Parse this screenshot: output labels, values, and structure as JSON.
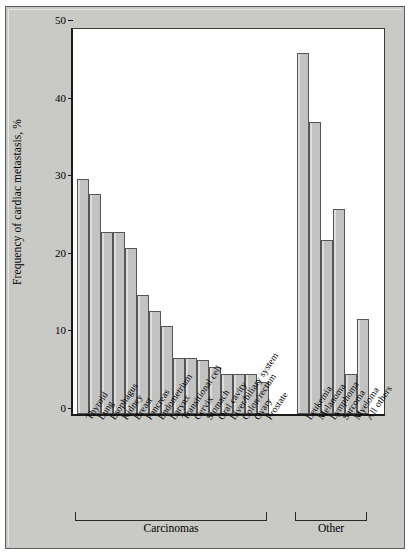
{
  "figure": {
    "background": "#c9c9c6",
    "plot_background": "#ffffff",
    "bar_fill": "#c2c2c0",
    "bar_stroke": "#56565a"
  },
  "chart_data": {
    "type": "bar",
    "title": "",
    "xlabel": "",
    "ylabel": "Frequency of cardiac metastasis, %",
    "ylim": [
      0,
      50
    ],
    "yticks": [
      0,
      10,
      20,
      30,
      40,
      50
    ],
    "ytick_labels": [
      "0",
      "10",
      "20",
      "30",
      "40",
      "50"
    ],
    "grid": false,
    "legend": "none",
    "categories": [
      "Thyroid",
      "Lung",
      "Esophagus",
      "Kidney",
      "Breast",
      "Pancreas",
      "Endometrium",
      "Larynx",
      "Transitional cell",
      "Cervix",
      "Stomach",
      "Oral cavity",
      "Liver/biliary system",
      "Colon/rectum",
      "Ovary",
      "Prostate",
      "Leukemia",
      "Melanoma",
      "Lymphoma",
      "Sarcoma",
      "Myeloma",
      "All others"
    ],
    "values": [
      30.3,
      28.4,
      23.5,
      23.5,
      21.4,
      15.3,
      13.3,
      11.3,
      7.2,
      7.2,
      7.0,
      6.1,
      5.2,
      5.2,
      5.2,
      4.1,
      46.5,
      37.6,
      22.4,
      26.4,
      5.1,
      12.3
    ],
    "groups": [
      {
        "label": "Carcinomas",
        "start_index": 0,
        "end_index": 15
      },
      {
        "label": "Other",
        "start_index": 16,
        "end_index": 21
      }
    ]
  }
}
